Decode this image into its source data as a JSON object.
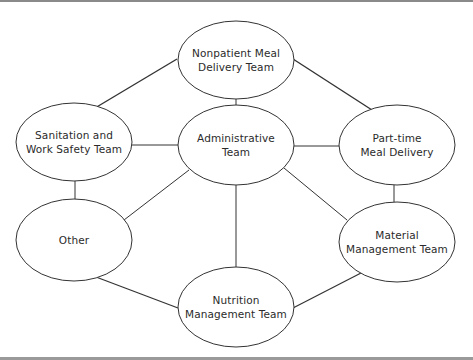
{
  "diagram": {
    "type": "organization-network",
    "colors": {
      "stroke": "#333333",
      "fill": "#ffffff",
      "text": "#2b2b2b",
      "frame": "#8a8a8a"
    },
    "nodes": [
      {
        "id": "nonpatient",
        "label_line1": "Nonpatient Meal",
        "label_line2": "Delivery Team",
        "cx": 236,
        "cy": 60,
        "rx": 58,
        "ry": 39
      },
      {
        "id": "sanitation",
        "label_line1": "Sanitation and",
        "label_line2": "Work Safety Team",
        "cx": 74,
        "cy": 142,
        "rx": 58,
        "ry": 39
      },
      {
        "id": "administrative",
        "label_line1": "Administrative",
        "label_line2": "Team",
        "cx": 236,
        "cy": 145,
        "rx": 58,
        "ry": 40
      },
      {
        "id": "parttime",
        "label_line1": "Part-time",
        "label_line2": "Meal Delivery",
        "cx": 397,
        "cy": 145,
        "rx": 58,
        "ry": 40
      },
      {
        "id": "other",
        "label_line1": "Other",
        "label_line2": "",
        "cx": 74,
        "cy": 240,
        "rx": 58,
        "ry": 41
      },
      {
        "id": "material",
        "label_line1": "Material",
        "label_line2": "Management Team",
        "cx": 397,
        "cy": 242,
        "rx": 58,
        "ry": 40
      },
      {
        "id": "nutrition",
        "label_line1": "Nutrition",
        "label_line2": "Management Team",
        "cx": 236,
        "cy": 307,
        "rx": 58,
        "ry": 40
      }
    ],
    "edges": [
      {
        "from": "nonpatient",
        "to": "sanitation",
        "x1": 177,
        "y1": 59,
        "x2": 95,
        "y2": 108,
        "width": 1.4
      },
      {
        "from": "nonpatient",
        "to": "parttime",
        "x1": 293,
        "y1": 59,
        "x2": 372,
        "y2": 110,
        "width": 1.4
      },
      {
        "from": "nonpatient",
        "to": "administrative",
        "x1": 236,
        "y1": 99,
        "x2": 236,
        "y2": 105,
        "width": 1
      },
      {
        "from": "sanitation",
        "to": "administrative",
        "x1": 132,
        "y1": 145,
        "x2": 178,
        "y2": 145,
        "width": 1
      },
      {
        "from": "administrative",
        "to": "parttime",
        "x1": 294,
        "y1": 146,
        "x2": 339,
        "y2": 146,
        "width": 1
      },
      {
        "from": "sanitation",
        "to": "other",
        "x1": 75,
        "y1": 181,
        "x2": 75,
        "y2": 200,
        "width": 1
      },
      {
        "from": "parttime",
        "to": "material",
        "x1": 394,
        "y1": 185,
        "x2": 394,
        "y2": 202,
        "width": 1
      },
      {
        "from": "administrative",
        "to": "other",
        "x1": 189,
        "y1": 170,
        "x2": 124,
        "y2": 220,
        "width": 1
      },
      {
        "from": "administrative",
        "to": "material",
        "x1": 284,
        "y1": 168,
        "x2": 347,
        "y2": 220,
        "width": 1
      },
      {
        "from": "administrative",
        "to": "nutrition",
        "x1": 236,
        "y1": 185,
        "x2": 236,
        "y2": 268,
        "width": 1
      },
      {
        "from": "other",
        "to": "nutrition",
        "x1": 96,
        "y1": 277,
        "x2": 178,
        "y2": 308,
        "width": 1.2
      },
      {
        "from": "material",
        "to": "nutrition",
        "x1": 361,
        "y1": 273,
        "x2": 293,
        "y2": 308,
        "width": 1.2
      }
    ]
  }
}
